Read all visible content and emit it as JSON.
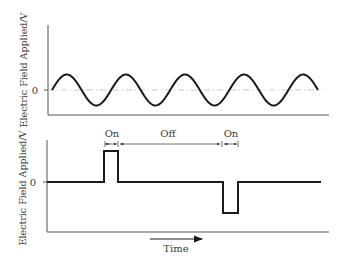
{
  "top_panel": {
    "ylabel": "Electric Field Applied/V",
    "zero_tick": "0",
    "waveform": "sine",
    "cycles": 4.5
  },
  "bottom_panel": {
    "ylabel": "Electric Field Applied/V",
    "zero_tick": "0",
    "waveform": "bipolar pulse",
    "annotations": [
      "On",
      "Off",
      "On"
    ],
    "xlabel": "Time"
  },
  "colors": {
    "signal": "#1a1a1a",
    "axis": "#555555",
    "zero_line": "#bbbbbb"
  }
}
